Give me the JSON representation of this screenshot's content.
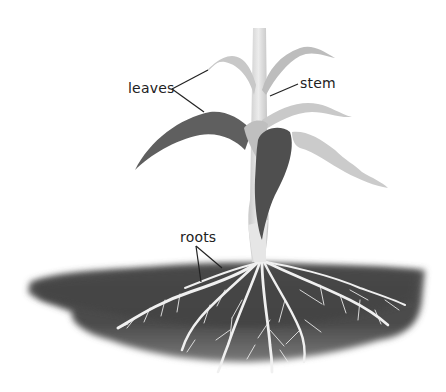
{
  "diagram": {
    "labels": {
      "leaves": "leaves",
      "stem": "stem",
      "roots": "roots"
    },
    "colors": {
      "background": "#ffffff",
      "soil": "#4a4a4a",
      "soil_edge": "#8a8a8a",
      "root": "#f2f2f2",
      "leaf_dark": "#5a5a5a",
      "leaf_light": "#c4c4c4",
      "stem": "#dcdcdc",
      "label_text": "#222222",
      "leader_line": "#222222"
    }
  }
}
